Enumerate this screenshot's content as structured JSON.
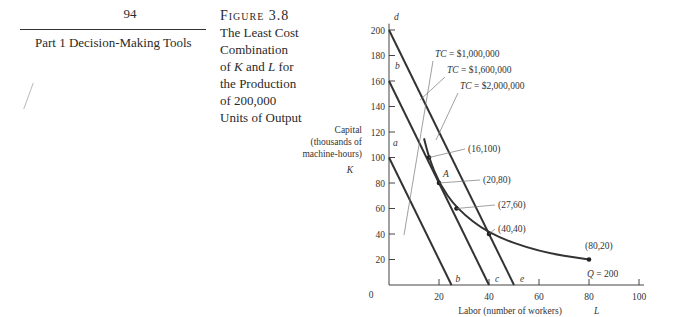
{
  "page": {
    "number": "94",
    "part_title": "Part 1   Decision-Making Tools"
  },
  "caption": {
    "label": "Figure 3.8",
    "lines": [
      "The Least Cost",
      "Combination",
      "of K and L for",
      "the Production",
      "of 200,000",
      "Units of Output"
    ]
  },
  "chart_data": {
    "type": "line",
    "title": "The Least Cost Combination of K and L for the Production of 200,000 Units of Output",
    "xlabel": "Labor (number of workers) L",
    "ylabel": "Capital (thousands of machine-hours) K",
    "ylabel_lines": [
      "Capital",
      "(thousands of",
      "machine-hours)",
      "K"
    ],
    "xlim": [
      0,
      100
    ],
    "ylim": [
      0,
      200
    ],
    "x_ticks": [
      20,
      40,
      60,
      80,
      100
    ],
    "y_ticks": [
      20,
      40,
      60,
      80,
      100,
      120,
      140,
      160,
      180,
      200
    ],
    "origin_label": "0",
    "grid": false,
    "series": [
      {
        "name": "TC = $1,000,000",
        "kind": "isocost",
        "endpoints_labels": [
          "a",
          "b"
        ],
        "points": [
          [
            0,
            100
          ],
          [
            25,
            0
          ]
        ]
      },
      {
        "name": "TC = $1,600,000",
        "kind": "isocost",
        "endpoints_labels": [
          "b",
          "c"
        ],
        "points": [
          [
            0,
            160
          ],
          [
            40,
            0
          ]
        ]
      },
      {
        "name": "TC = $2,000,000",
        "kind": "isocost",
        "endpoints_labels": [
          "d",
          "e"
        ],
        "points": [
          [
            0,
            200
          ],
          [
            50,
            0
          ]
        ]
      },
      {
        "name": "Q = 200",
        "kind": "isoquant",
        "points": [
          [
            14,
            115
          ],
          [
            16,
            100
          ],
          [
            20,
            80
          ],
          [
            27,
            60
          ],
          [
            40,
            40
          ],
          [
            60,
            26
          ],
          [
            80,
            20
          ]
        ]
      }
    ],
    "annotations": [
      {
        "text": "(16,100)",
        "point": [
          16,
          100
        ]
      },
      {
        "text": "(20,80)",
        "point": [
          20,
          80
        ],
        "marker_label": "A"
      },
      {
        "text": "(27,60)",
        "point": [
          27,
          60
        ]
      },
      {
        "text": "(40,40)",
        "point": [
          40,
          40
        ]
      },
      {
        "text": "(80,20)",
        "point": [
          80,
          20
        ]
      },
      {
        "text": "Q = 200",
        "point": [
          80,
          20
        ]
      }
    ],
    "axis_letters": {
      "y_top": "d",
      "y_160": "b",
      "y_100": "a",
      "x_25": "b",
      "x_40": "c",
      "x_50": "e"
    }
  }
}
